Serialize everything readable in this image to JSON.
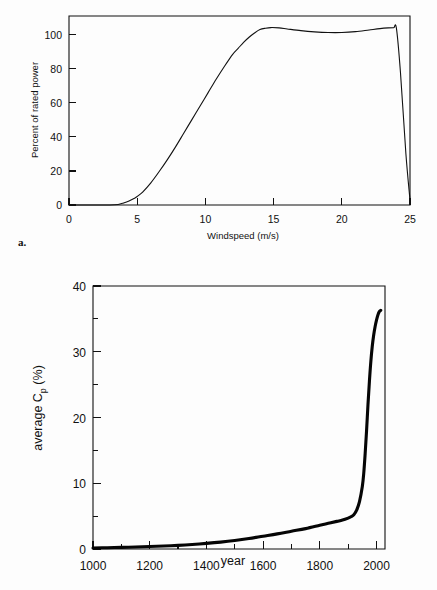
{
  "figure": {
    "panel_a_letter": "a.",
    "panel_b_letter": "b."
  },
  "chart_data": [
    {
      "id": "panel-a",
      "type": "line",
      "title": "",
      "xlabel": "Windspeed (m/s)",
      "ylabel": "Percent of rated power",
      "xlim": [
        0,
        25
      ],
      "ylim": [
        0,
        111
      ],
      "xticks": [
        0,
        5,
        10,
        15,
        20,
        25
      ],
      "xtick_labels": [
        "0",
        "5",
        "10",
        "15",
        "20",
        "25"
      ],
      "yticks": [
        0,
        20,
        40,
        60,
        80,
        100
      ],
      "ytick_labels": [
        "0",
        "20",
        "40",
        "60",
        "80",
        "100"
      ],
      "grid": false,
      "legend": "none",
      "frame": "box",
      "series": [
        {
          "name": "power curve",
          "x": [
            0,
            1,
            2,
            3,
            3.6,
            4.0,
            4.4,
            4.8,
            5.0,
            5.4,
            6.0,
            6.6,
            7.2,
            7.8,
            8.4,
            9.0,
            9.6,
            10.2,
            10.8,
            11.4,
            12.0,
            12.4,
            12.8,
            13.2,
            13.6,
            14.0,
            14.4,
            14.8,
            15.4,
            16.0,
            17.0,
            18.0,
            19.0,
            20.0,
            21.0,
            22.0,
            22.8,
            23.4,
            23.8,
            24.0,
            24.3,
            24.7,
            25.0
          ],
          "y": [
            0,
            0,
            0,
            0,
            0.3,
            1.2,
            2.4,
            4.0,
            5.0,
            7.6,
            13.0,
            19.5,
            26.5,
            34.0,
            42.0,
            50.0,
            58.0,
            66.0,
            74.0,
            81.5,
            88.5,
            92.0,
            95.5,
            98.5,
            101.0,
            103.0,
            103.8,
            104.2,
            104.0,
            103.4,
            102.4,
            101.7,
            101.3,
            101.3,
            101.8,
            102.8,
            103.6,
            104.0,
            104.1,
            104.0,
            78.0,
            30.0,
            3.0
          ]
        }
      ]
    },
    {
      "id": "panel-b",
      "type": "line",
      "title": "",
      "xlabel": "year",
      "ylabel_parts": [
        "average  C",
        "p",
        " (%)"
      ],
      "ylabel": "average Cp (%)",
      "xlim": [
        1000,
        2030
      ],
      "ylim": [
        0,
        40
      ],
      "xticks": [
        1000,
        1200,
        1400,
        1600,
        1800,
        2000
      ],
      "xtick_labels": [
        "1000",
        "1200",
        "1400",
        "1600",
        "1800",
        "2000"
      ],
      "xticks_minor": [
        1100,
        1300,
        1500,
        1700,
        1900
      ],
      "yticks": [
        0,
        10,
        20,
        30,
        40
      ],
      "ytick_labels": [
        "0",
        "10",
        "20",
        "30",
        "40"
      ],
      "yticks_minor": [
        5,
        15,
        25,
        35
      ],
      "grid": false,
      "legend": "none",
      "frame": "box",
      "series": [
        {
          "name": "average power coefficient",
          "x": [
            1000,
            1050,
            1100,
            1150,
            1200,
            1250,
            1300,
            1350,
            1400,
            1450,
            1500,
            1550,
            1600,
            1650,
            1700,
            1750,
            1800,
            1830,
            1860,
            1880,
            1900,
            1910,
            1920,
            1930,
            1940,
            1950,
            1955,
            1960,
            1965,
            1970,
            1975,
            1980,
            1985,
            1990,
            1995,
            2000,
            2005,
            2010,
            2015
          ],
          "y": [
            0.15,
            0.2,
            0.25,
            0.3,
            0.38,
            0.45,
            0.55,
            0.68,
            0.85,
            1.05,
            1.3,
            1.6,
            1.95,
            2.3,
            2.7,
            3.1,
            3.6,
            3.9,
            4.2,
            4.4,
            4.7,
            4.9,
            5.2,
            5.9,
            7.2,
            9.5,
            11.5,
            14.5,
            18.0,
            22.0,
            25.5,
            28.5,
            30.8,
            32.5,
            33.8,
            34.8,
            35.6,
            36.1,
            36.3
          ]
        }
      ]
    }
  ]
}
